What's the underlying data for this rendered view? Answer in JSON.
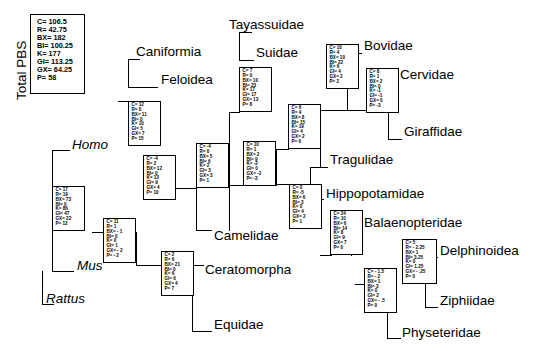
{
  "figure": {
    "type": "phylogenetic-tree-partitioned-bremer-support",
    "legend_title": "Total PBS",
    "legend": {
      "rows": [
        "C= 106.5",
        "R= 42.75",
        "BX= 182",
        "BI= 100.25",
        "K= 177",
        "GI= 113.25",
        "GX= 64.25",
        "P= 58"
      ]
    }
  },
  "taxa": [
    {
      "id": "caniformia",
      "label": "Caniformia",
      "italic": false,
      "x": 136,
      "y": 44
    },
    {
      "id": "feloidea",
      "label": "Feloidea",
      "italic": false,
      "x": 161,
      "y": 72
    },
    {
      "id": "tayassuidae",
      "label": "Tayassuidae",
      "italic": false,
      "x": 229,
      "y": 17
    },
    {
      "id": "suidae",
      "label": "Suidae",
      "italic": false,
      "x": 256,
      "y": 45
    },
    {
      "id": "bovidae",
      "label": "Bovidae",
      "italic": false,
      "x": 364,
      "y": 38
    },
    {
      "id": "cervidae",
      "label": "Cervidae",
      "italic": false,
      "x": 400,
      "y": 67
    },
    {
      "id": "giraffidae",
      "label": "Giraffidae",
      "italic": false,
      "x": 404,
      "y": 124
    },
    {
      "id": "tragulidae",
      "label": "Tragulidae",
      "italic": false,
      "x": 330,
      "y": 152
    },
    {
      "id": "hippopotamidae",
      "label": "Hippopotamidae",
      "italic": false,
      "x": 326,
      "y": 186
    },
    {
      "id": "balaenopteridae",
      "label": "Balaenopteridae",
      "italic": false,
      "x": 364,
      "y": 215
    },
    {
      "id": "delphinoidea",
      "label": "Delphinoidea",
      "italic": false,
      "x": 440,
      "y": 243
    },
    {
      "id": "ziphiidae",
      "label": "Ziphiidae",
      "italic": false,
      "x": 440,
      "y": 293
    },
    {
      "id": "physeteridae",
      "label": "Physeteridae",
      "italic": false,
      "x": 402,
      "y": 325
    },
    {
      "id": "camelidae",
      "label": "Camelidae",
      "italic": false,
      "x": 214,
      "y": 228
    },
    {
      "id": "ceratomorpha",
      "label": "Ceratomorpha",
      "italic": false,
      "x": 205,
      "y": 262
    },
    {
      "id": "equidae",
      "label": "Equidae",
      "italic": false,
      "x": 214,
      "y": 317
    },
    {
      "id": "homo",
      "label": "Homo",
      "italic": true,
      "x": 72,
      "y": 137
    },
    {
      "id": "mus",
      "label": "Mus",
      "italic": true,
      "x": 77,
      "y": 258
    },
    {
      "id": "rattus",
      "label": "Rattus",
      "italic": true,
      "x": 46,
      "y": 291
    }
  ],
  "pbs_boxes": [
    {
      "id": "box-carnivora",
      "x": 128,
      "y": 101,
      "w": 33,
      "h": 45,
      "rows": [
        "C= 12",
        "R= 0",
        "BX= 11",
        "BI= 0",
        "K= 10",
        "GI= 5",
        "GX= 7",
        "P= 15"
      ]
    },
    {
      "id": "box-suina",
      "x": 239,
      "y": 67,
      "w": 33,
      "h": 45,
      "rows": [
        "C= 7",
        "R= 0",
        "BX= 10",
        "BI= 23",
        "K= 17",
        "GI= 17",
        "GX= 13",
        "P= 8"
      ]
    },
    {
      "id": "box-bovidae-node",
      "x": 326,
      "y": 44,
      "w": 33,
      "h": 45,
      "rows": [
        "C= 10",
        "R= 4",
        "BX= 10",
        "BI= 22",
        "K= 6",
        "GI= 4",
        "GX= 2",
        "P= 2"
      ]
    },
    {
      "id": "box-cervidae-node",
      "x": 366,
      "y": 68,
      "w": 33,
      "h": 45,
      "rows": [
        "C= 8",
        "R= 1",
        "BX= 2",
        "BI= 0",
        "K= -1",
        "GI= -1",
        "GX= 0",
        "P= -3"
      ]
    },
    {
      "id": "box-pecora",
      "x": 288,
      "y": 104,
      "w": 33,
      "h": 45,
      "rows": [
        "C= 6",
        "R= 4",
        "BX= 8",
        "BI= 15",
        "K= 19",
        "GI= 4",
        "GX= 2",
        "P= 0"
      ]
    },
    {
      "id": "box-ruminantia",
      "x": 243,
      "y": 141,
      "w": 33,
      "h": 45,
      "rows": [
        "C= 10",
        "R= 1",
        "BX= 2",
        "BI= 9",
        "K= -2",
        "GI= 0",
        "GX= -2",
        "P= -3"
      ]
    },
    {
      "id": "box-artio-a",
      "x": 196,
      "y": 143,
      "w": 33,
      "h": 45,
      "rows": [
        "C= -4",
        "R= 0",
        "BX= 5",
        "BI= 6",
        "K= 2",
        "GI= 3",
        "GX= 3",
        "P= 1"
      ]
    },
    {
      "id": "box-cetancodonta",
      "x": 289,
      "y": 184,
      "w": 33,
      "h": 45,
      "rows": [
        "C= 0",
        "R= -5",
        "BX= 6",
        "BI= 3",
        "K= 0",
        "GI= 4",
        "GX= 2",
        "P= 1"
      ]
    },
    {
      "id": "box-cetacea",
      "x": 330,
      "y": 210,
      "w": 33,
      "h": 45,
      "rows": [
        "C= 24",
        "R= 10",
        "BX= 6",
        "BI= 14",
        "K= 8",
        "GI= 9",
        "GX= 7",
        "P= 0"
      ]
    },
    {
      "id": "box-odontoceti",
      "x": 402,
      "y": 239,
      "w": 35,
      "h": 45,
      "rows": [
        "C= 5",
        "R= - 2.25",
        "BX= 1",
        "BI= 3.25",
        "K= 0",
        "GI= 1.25",
        "GX= - .25",
        "P= 0"
      ]
    },
    {
      "id": "box-physeteroidea",
      "x": 364,
      "y": 268,
      "w": 33,
      "h": 45,
      "rows": [
        "C= - 1.5",
        "R= - 2",
        "BX= 1",
        "BI= 3",
        "K= 0",
        "GI= 2",
        "GX= - .5",
        "P= 0"
      ]
    },
    {
      "id": "box-artio-b",
      "x": 143,
      "y": 155,
      "w": 33,
      "h": 45,
      "rows": [
        "C= -4",
        "R= 2",
        "BX= 12",
        "BI= 0",
        "K= 13",
        "GI= 9",
        "GX= 4",
        "P= 10"
      ]
    },
    {
      "id": "box-laurasiatheria",
      "x": 103,
      "y": 218,
      "w": 33,
      "h": 45,
      "rows": [
        "C= 11",
        "R= 1",
        "BX= - 1",
        "BI= 0",
        "K= 0",
        "GI= 1",
        "GX= - 2",
        "P= - 2"
      ]
    },
    {
      "id": "box-perissodactyla",
      "x": 161,
      "y": 251,
      "w": 33,
      "h": 45,
      "rows": [
        "C= 2",
        "R= 6",
        "BX= 21",
        "BI= 0",
        "K= 6",
        "GI= 6",
        "GX= 4",
        "P= 7"
      ]
    },
    {
      "id": "box-euarchontoglires",
      "x": 52,
      "y": 186,
      "w": 33,
      "h": 45,
      "rows": [
        "C= 17",
        "R= 19",
        "BX= 73",
        "BI= 0",
        "K= 86",
        "GI= 47",
        "GX= 22",
        "P= 12"
      ]
    }
  ],
  "branches": {
    "horizontal": [
      {
        "id": "h-caniformia",
        "x": 128,
        "y": 59,
        "w": 12
      },
      {
        "id": "h-feloidea",
        "x": 128,
        "y": 87,
        "w": 30
      },
      {
        "id": "h-carnivora-stem",
        "x": 118,
        "y": 101,
        "w": 11
      },
      {
        "id": "h-tayassuidae",
        "x": 239,
        "y": 32,
        "w": 13
      },
      {
        "id": "h-suidae",
        "x": 239,
        "y": 60,
        "w": 15
      },
      {
        "id": "h-suina-stem",
        "x": 229,
        "y": 112,
        "w": 11
      },
      {
        "id": "h-bovidae",
        "x": 347,
        "y": 53,
        "w": 15
      },
      {
        "id": "h-cervidae",
        "x": 388,
        "y": 82,
        "w": 11
      },
      {
        "id": "h-giraffidae",
        "x": 388,
        "y": 139,
        "w": 14
      },
      {
        "id": "h-bov-cerv",
        "x": 320,
        "y": 110,
        "w": 48
      },
      {
        "id": "h-tragulidae",
        "x": 310,
        "y": 167,
        "w": 18
      },
      {
        "id": "h-pecora-stem",
        "x": 276,
        "y": 149,
        "w": 13
      },
      {
        "id": "h-rum-stem",
        "x": 229,
        "y": 185,
        "w": 15
      },
      {
        "id": "h-camelidae",
        "x": 196,
        "y": 230,
        "w": 16
      },
      {
        "id": "h-artioa-stem",
        "x": 176,
        "y": 188,
        "w": 21
      },
      {
        "id": "h-hippo",
        "x": 310,
        "y": 199,
        "w": 14
      },
      {
        "id": "h-cetancodonta-top",
        "x": 276,
        "y": 184,
        "w": 14
      },
      {
        "id": "h-balaenopteridae",
        "x": 351,
        "y": 228,
        "w": 11
      },
      {
        "id": "h-cetacea-stem",
        "x": 320,
        "y": 255,
        "w": 12
      },
      {
        "id": "h-delphinoidea",
        "x": 425,
        "y": 257,
        "w": 13
      },
      {
        "id": "h-ziphiidae",
        "x": 425,
        "y": 307,
        "w": 13
      },
      {
        "id": "h-physeteridae",
        "x": 387,
        "y": 338,
        "w": 14
      },
      {
        "id": "h-physet-stem",
        "x": 355,
        "y": 284,
        "w": 10
      },
      {
        "id": "h-laur-stem",
        "x": 92,
        "y": 232,
        "w": 12
      },
      {
        "id": "h-ceratomorpha",
        "x": 192,
        "y": 265,
        "w": 12
      },
      {
        "id": "h-equidae",
        "x": 192,
        "y": 331,
        "w": 20
      },
      {
        "id": "h-perisso-stem",
        "x": 136,
        "y": 265,
        "w": 26
      },
      {
        "id": "h-homo",
        "x": 52,
        "y": 150,
        "w": 18
      },
      {
        "id": "h-mus",
        "x": 52,
        "y": 271,
        "w": 22
      },
      {
        "id": "h-rattus",
        "x": 42,
        "y": 304,
        "w": 12
      }
    ],
    "vertical": [
      {
        "id": "v-carnivora",
        "x": 128,
        "y": 59,
        "h": 29
      },
      {
        "id": "v-suina",
        "x": 239,
        "y": 32,
        "h": 29
      },
      {
        "id": "v-bovcerv-left",
        "x": 347,
        "y": 53,
        "h": 58
      },
      {
        "id": "v-bovcerv-right",
        "x": 388,
        "y": 82,
        "h": 58
      },
      {
        "id": "v-pecora",
        "x": 320,
        "y": 110,
        "h": 58
      },
      {
        "id": "v-ruminantia",
        "x": 276,
        "y": 149,
        "h": 37
      },
      {
        "id": "v-artioa",
        "x": 229,
        "y": 112,
        "h": 119
      },
      {
        "id": "v-cetanc",
        "x": 310,
        "y": 167,
        "h": 33
      },
      {
        "id": "v-cetacea",
        "x": 351,
        "y": 228,
        "h": 28
      },
      {
        "id": "v-odonto",
        "x": 425,
        "y": 257,
        "h": 51
      },
      {
        "id": "v-physet",
        "x": 387,
        "y": 284,
        "h": 55
      },
      {
        "id": "v-artiob",
        "x": 196,
        "y": 188,
        "h": 43
      },
      {
        "id": "v-laurasia",
        "x": 136,
        "y": 232,
        "h": 34
      },
      {
        "id": "v-perisso",
        "x": 192,
        "y": 265,
        "h": 67
      },
      {
        "id": "v-euarcho",
        "x": 52,
        "y": 150,
        "h": 122
      },
      {
        "id": "v-rodentia",
        "x": 42,
        "y": 271,
        "h": 34
      }
    ]
  }
}
